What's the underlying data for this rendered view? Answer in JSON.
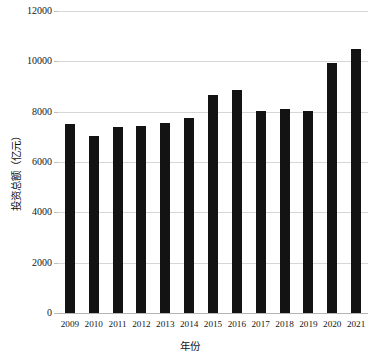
{
  "chart_data": {
    "type": "bar",
    "title": "",
    "xlabel": "年份",
    "ylabel": "投资总额（亿元）",
    "categories": [
      "2009",
      "2010",
      "2011",
      "2012",
      "2013",
      "2014",
      "2015",
      "2016",
      "2017",
      "2018",
      "2019",
      "2020",
      "2021"
    ],
    "values": [
      7520,
      7030,
      7380,
      7450,
      7560,
      7730,
      8680,
      8850,
      8030,
      8100,
      8010,
      9950,
      10500
    ],
    "series": [
      {
        "name": "投资总额",
        "values": [
          7520,
          7030,
          7380,
          7450,
          7560,
          7730,
          8680,
          8850,
          8030,
          8100,
          8010,
          9950,
          10500
        ]
      }
    ],
    "ylim": [
      0,
      12000
    ],
    "yticks": [
      0,
      2000,
      4000,
      6000,
      8000,
      10000,
      12000
    ],
    "ytick_labels": [
      "0",
      "2000",
      "4000",
      "6000",
      "8000",
      "10000",
      "12000"
    ],
    "grid": true,
    "legend": false,
    "bar_color": "#131313",
    "grid_color": "#d6d6d6",
    "axis_color": "#b4b4b4"
  }
}
